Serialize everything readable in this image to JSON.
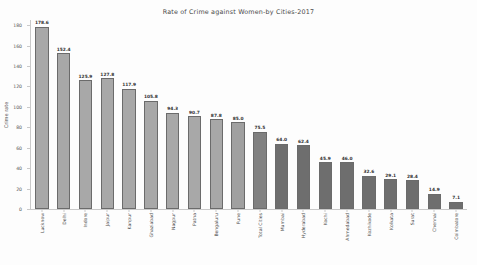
{
  "chart_data": {
    "type": "bar",
    "title": "Rate of Crime against Women-by Cities-2017",
    "xlabel": "",
    "ylabel": "Crime rate",
    "ylim": [
      0,
      185
    ],
    "yticks": [
      0,
      20,
      40,
      60,
      80,
      100,
      120,
      140,
      160,
      180
    ],
    "grid": false,
    "legend": null,
    "categories": [
      "Lucknow",
      "Delhi",
      "Indore",
      "Jaipur",
      "Kanpur",
      "Ghaziabad",
      "Nagpur",
      "Patna",
      "Bengaluru",
      "Pune",
      "Total Cities",
      "Mumbai",
      "Hyderabad",
      "Kochi",
      "Ahmedabad",
      "Kozhikode",
      "Kolkata",
      "Surat",
      "Chennai",
      "Coimbatore"
    ],
    "values": [
      178.6,
      152.4,
      125.9,
      127.8,
      117.9,
      105.8,
      94.3,
      90.7,
      87.8,
      85.0,
      75.5,
      64.0,
      62.4,
      45.9,
      46.0,
      32.6,
      29.1,
      28.4,
      14.9,
      7.1
    ],
    "value_labels": [
      "178.6",
      "152.4",
      "125.9",
      "127.8",
      "117.9",
      "105.8",
      "94.3",
      "90.7",
      "87.8",
      "85.0",
      "75.5",
      "64.0",
      "62.4",
      "45.9",
      "46.0",
      "32.6",
      "29.1",
      "28.4",
      "14.9",
      "7.1"
    ],
    "bar_colors": [
      "#a8a8a8",
      "#a8a8a8",
      "#a8a8a8",
      "#a8a8a8",
      "#a8a8a8",
      "#a8a8a8",
      "#a8a8a8",
      "#a8a8a8",
      "#a8a8a8",
      "#a0a0a0",
      "#818181",
      "#6e6e6e",
      "#6e6e6e",
      "#6e6e6e",
      "#6e6e6e",
      "#6e6e6e",
      "#6e6e6e",
      "#6e6e6e",
      "#6e6e6e",
      "#6e6e6e"
    ]
  },
  "colors": {
    "axis": "#c9c9c9",
    "text": "#4a4a4a",
    "background": "#fdfdfd"
  }
}
